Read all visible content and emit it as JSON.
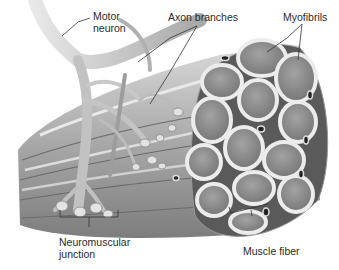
{
  "diagram": {
    "labels": {
      "motor_neuron_line1": "Motor",
      "motor_neuron_line2": "neuron",
      "axon_branches": "Axon branches",
      "myofibrils": "Myofibrils",
      "nmj_line1": "Neuromuscular",
      "nmj_line2": "junction",
      "muscle_fiber": "Muscle fiber"
    },
    "colors": {
      "background": "#ffffff",
      "fiber_fill": "#8f8f8f",
      "fiber_rim": "#e6e6e6",
      "neuron": "#c9c9c9",
      "bundle": "#b5b5b5",
      "leader_line": "#333333"
    }
  }
}
